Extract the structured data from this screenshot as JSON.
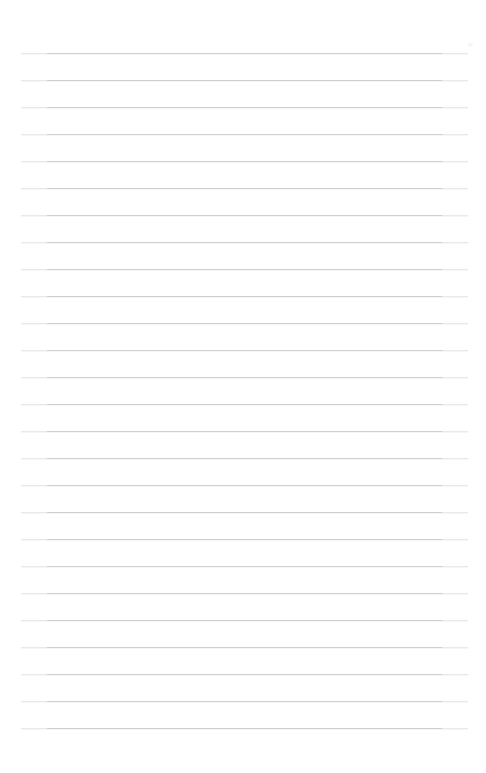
{
  "page": {
    "kind": "blank-ruled-notebook-page",
    "width": 486,
    "height": 773,
    "background_color": "#ffffff",
    "body_text": "",
    "heading_text": "",
    "page_number_text": ""
  },
  "ruling": {
    "line_color": "#cfcfd2",
    "line_thickness_px": 1,
    "line_count": 26,
    "line_left_px": 21,
    "line_right_px": 468,
    "line_width_px": 447,
    "first_line_y_px": 53,
    "line_spacing_px": 27,
    "last_line_y_px": 728,
    "has_vertical_margin_rule": false,
    "line_y_positions": [
      53,
      80,
      107,
      134,
      161,
      188,
      215,
      242,
      269,
      296,
      323,
      350,
      377,
      404,
      431,
      458,
      485,
      512,
      539,
      566,
      593,
      620,
      647,
      674,
      701,
      728
    ]
  },
  "marks": {
    "corner_speck": {
      "label": "faint-speck",
      "x_px": 468,
      "y_px": 43,
      "color": "#f4f4f5"
    }
  }
}
